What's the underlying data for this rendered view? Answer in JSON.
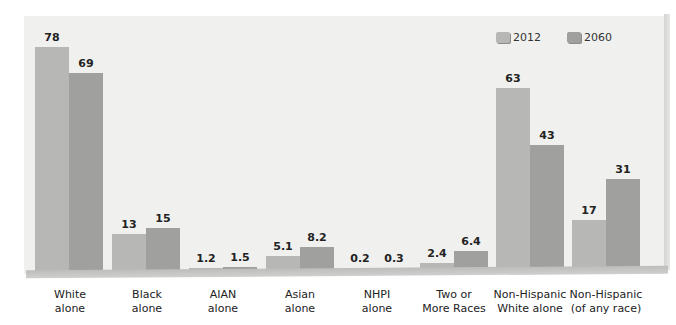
{
  "chart_data": {
    "type": "bar",
    "title": "",
    "xlabel": "",
    "ylabel": "",
    "ylim": [
      0,
      80
    ],
    "grid": false,
    "legend_position": "top-right",
    "categories": [
      "White alone",
      "Black alone",
      "AIAN alone",
      "Asian alone",
      "NHPI alone",
      "Two or More Races",
      "Non-Hispanic White alone",
      "Non-Hispanic (of any race)"
    ],
    "series": [
      {
        "name": "2012",
        "color": "#b7b7b6",
        "values": [
          78,
          13,
          1.2,
          5.1,
          0.2,
          2.4,
          63,
          17
        ]
      },
      {
        "name": "2060",
        "color": "#a0a09f",
        "values": [
          69,
          15,
          1.5,
          8.2,
          0.3,
          6.4,
          43,
          31
        ]
      }
    ]
  },
  "legend": {
    "items": [
      {
        "label": "2012"
      },
      {
        "label": "2060"
      }
    ]
  },
  "labels": {
    "cat0": [
      "White",
      "alone"
    ],
    "cat1": [
      "Black",
      "alone"
    ],
    "cat2": [
      "AIAN",
      "alone"
    ],
    "cat3": [
      "Asian",
      "alone"
    ],
    "cat4": [
      "NHPI",
      "alone"
    ],
    "cat5": [
      "Two or",
      "More Races"
    ],
    "cat6": [
      "Non-Hispanic",
      "White alone"
    ],
    "cat7": [
      "Non-Hispanic",
      "(of any race)"
    ]
  },
  "value_labels": {
    "s2012": [
      "78",
      "13",
      "1.2",
      "5.1",
      "0.2",
      "2.4",
      "63",
      "17"
    ],
    "s2060": [
      "69",
      "15",
      "1.5",
      "8.2",
      "0.3",
      "6.4",
      "43",
      "31"
    ]
  }
}
